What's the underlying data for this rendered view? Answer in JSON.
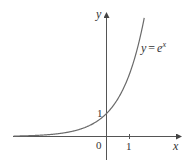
{
  "chart_data": {
    "type": "line",
    "title": "",
    "function_label": "y = e^x",
    "function_label_parts": {
      "lhs": "y",
      "eq": "=",
      "base": "e",
      "exp": "x"
    },
    "xlabel": "x",
    "ylabel": "y",
    "x_ticks": [
      0,
      1
    ],
    "x_tick_labels": [
      "0",
      "1"
    ],
    "y_ticks": [
      1
    ],
    "y_tick_labels": [
      "1"
    ],
    "xlim": [
      -4.05,
      3.2
    ],
    "ylim": [
      -1.3,
      5.9
    ],
    "grid": false,
    "legend": "none",
    "series": [
      {
        "name": "y = e^x",
        "x": [
          -4,
          -3,
          -2,
          -1.5,
          -1,
          -0.5,
          0,
          0.5,
          1,
          1.25,
          1.5,
          1.66
        ],
        "y": [
          0.018,
          0.05,
          0.135,
          0.223,
          0.368,
          0.607,
          1,
          1.649,
          2.718,
          3.49,
          4.482,
          5.26
        ]
      }
    ],
    "annotations": [
      {
        "text": "1",
        "at": [
          0,
          1
        ],
        "note": "y-intercept"
      }
    ]
  },
  "colors": {
    "axis": "#555555",
    "curve": "#6a6a6a",
    "text": "#333333"
  }
}
